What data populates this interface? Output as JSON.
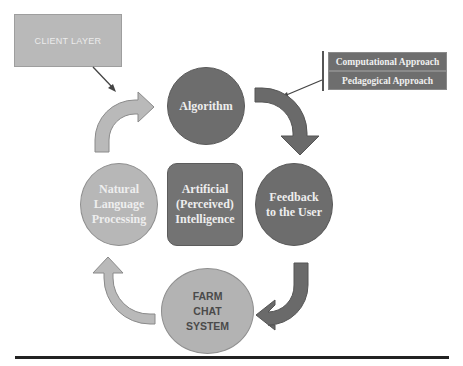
{
  "diagram": {
    "client_layer": {
      "label": "CLIENT LAYER"
    },
    "approaches": [
      {
        "label": "Computational Approach"
      },
      {
        "label": "Pedagogical Approach"
      }
    ],
    "nodes": {
      "algorithm": {
        "label": "Algorithm"
      },
      "nlp": {
        "lines": [
          "Natural",
          "Language",
          "Processing"
        ]
      },
      "ai": {
        "lines": [
          "Artificial",
          "(Perceived)",
          "Intelligence"
        ]
      },
      "feedback": {
        "lines": [
          "Feedback",
          "to the User"
        ]
      },
      "farm_chat": {
        "lines": [
          "FARM",
          "CHAT",
          "SYSTEM"
        ]
      }
    },
    "flow": [
      "Natural Language Processing -> Algorithm",
      "Algorithm -> Feedback to the User",
      "Feedback to the User -> FARM CHAT SYSTEM",
      "FARM CHAT SYSTEM -> Natural Language Processing"
    ],
    "colors": {
      "dark_node": "#6d6d6d",
      "light_node": "#b7b7b7",
      "dark_arrow": "#6a6a6a",
      "light_arrow": "#b9b9b9"
    }
  }
}
